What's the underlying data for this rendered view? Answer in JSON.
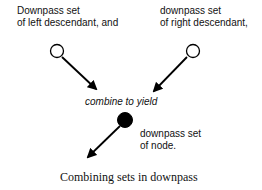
{
  "diagram": {
    "left_input": {
      "line1": "Downpass set",
      "line2": "of left descendant, and"
    },
    "right_input": {
      "line1": "downpass set",
      "line2": "of right descendant,"
    },
    "operation": "combine to yield",
    "output": {
      "line1": "downpass set",
      "line2": "of node."
    },
    "caption": "Combining sets in downpass",
    "nodes": [
      {
        "id": "left-descendant",
        "fill": "#ffffff",
        "stroke": "#000000"
      },
      {
        "id": "right-descendant",
        "fill": "#ffffff",
        "stroke": "#000000"
      },
      {
        "id": "node",
        "fill": "#000000",
        "stroke": "#000000"
      }
    ]
  }
}
